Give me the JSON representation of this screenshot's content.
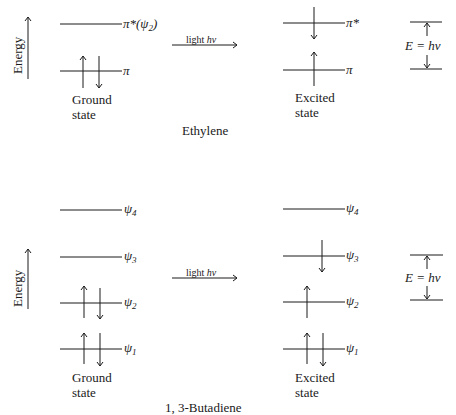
{
  "ethylene": {
    "title": "Ethylene",
    "axis_label": "Energy",
    "arrow_label": "light hν",
    "ground_label_1": "Ground",
    "ground_label_2": "state",
    "excited_label_1": "Excited",
    "excited_label_2": "state",
    "levels": [
      {
        "name": "π*",
        "ground_label": "π*(ψ",
        "ground_sub": "2",
        "ground_tail": ")",
        "excited_label": "π*",
        "ground_electrons": "",
        "excited_electrons": "down"
      },
      {
        "name": "π",
        "ground_label": "π",
        "excited_label": "π",
        "ground_electrons": "up-down",
        "excited_electrons": "up"
      }
    ],
    "gap_label": "E = hν"
  },
  "butadiene": {
    "title": "1, 3-Butadiene",
    "axis_label": "Energy",
    "arrow_label": "light hν",
    "ground_label_1": "Ground",
    "ground_label_2": "state",
    "excited_label_1": "Excited",
    "excited_label_2": "state",
    "levels": [
      {
        "name": "ψ4",
        "symbol": "ψ",
        "sub": "4",
        "ground_electrons": "",
        "excited_electrons": ""
      },
      {
        "name": "ψ3",
        "symbol": "ψ",
        "sub": "3",
        "ground_electrons": "",
        "excited_electrons": "down"
      },
      {
        "name": "ψ2",
        "symbol": "ψ",
        "sub": "2",
        "ground_electrons": "up-down",
        "excited_electrons": "up"
      },
      {
        "name": "ψ1",
        "symbol": "ψ",
        "sub": "1",
        "ground_electrons": "up-down",
        "excited_electrons": "up-down"
      }
    ],
    "gap_label": "E = hν"
  }
}
